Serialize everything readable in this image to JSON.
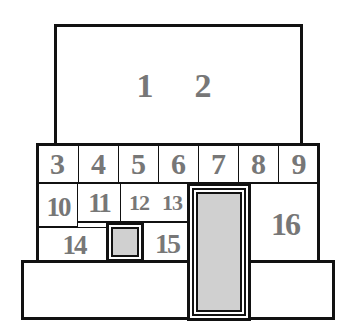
{
  "diagram": {
    "title_area": {
      "labels": [
        "1",
        "2"
      ]
    },
    "row_top": {
      "cells": [
        "3",
        "4",
        "5",
        "6",
        "7",
        "8",
        "9"
      ]
    },
    "row_mid": {
      "cells": [
        "10",
        "11",
        "12",
        "13"
      ]
    },
    "row_low": {
      "cells": [
        "14",
        "15"
      ]
    },
    "right_cell": "16",
    "colors": {
      "stroke": "#111111",
      "label": "#777777",
      "fill_gray": "#d0d0d0",
      "background": "#ffffff"
    }
  }
}
